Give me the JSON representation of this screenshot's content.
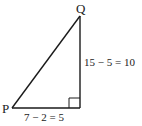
{
  "diagram": {
    "type": "right-triangle",
    "vertices": {
      "P": {
        "label": "P",
        "x": 12,
        "y": 108
      },
      "R": {
        "label": "",
        "x": 80,
        "y": 108
      },
      "Q": {
        "label": "Q",
        "x": 80,
        "y": 16
      }
    },
    "labels": {
      "P": "P",
      "Q": "Q",
      "vertical_side": "15 − 5 = 10",
      "horizontal_side": "7 − 2 = 5"
    },
    "right_angle_marker": true,
    "colors": {
      "stroke": "#1a1a1a",
      "text": "#222222",
      "background": "#ffffff"
    }
  }
}
